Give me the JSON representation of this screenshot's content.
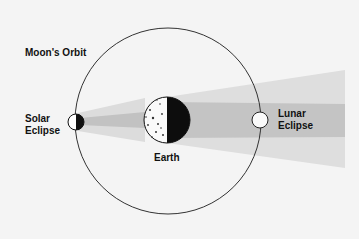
{
  "diagram": {
    "labels": {
      "orbit": "Moon's Orbit",
      "solar_line1": "Solar",
      "solar_line2": "Eclipse",
      "lunar_line1": "Lunar",
      "lunar_line2": "Eclipse",
      "earth": "Earth"
    },
    "colors": {
      "background": "#f4f4f4",
      "penumbra": "#dcdcdc",
      "umbra": "#c2c2c2",
      "orbit_line": "#333333",
      "body_dark": "#111111",
      "body_light": "#ffffff"
    }
  }
}
